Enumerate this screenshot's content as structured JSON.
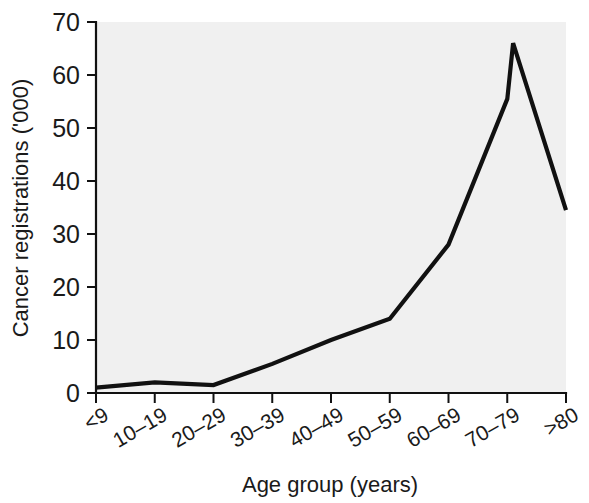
{
  "chart_data": {
    "type": "line",
    "title": "",
    "xlabel": "Age group (years)",
    "ylabel": "Cancer registrations ('000)",
    "categories": [
      "<9",
      "10–19",
      "20–29",
      "30–39",
      "40–49",
      "50–59",
      "60–69",
      "70–79",
      ">80"
    ],
    "values": [
      1,
      2,
      1.5,
      5.5,
      10,
      14,
      28,
      55.5,
      34.5
    ],
    "peak": {
      "label": "between 70–79 and >80",
      "value": 66
    },
    "series": [
      {
        "name": "Cancer registrations",
        "values": [
          1,
          2,
          1.5,
          5.5,
          10,
          14,
          28,
          55.5,
          34.5
        ]
      }
    ],
    "yticks": [
      0,
      10,
      20,
      30,
      40,
      50,
      60,
      70
    ],
    "ylim": [
      0,
      70
    ],
    "xlim_categories": 9,
    "grid": false,
    "legend": false,
    "legend_position": "none",
    "line_color": "#111111",
    "plot_background": "#f0f0f0",
    "page_background": "#ffffff"
  },
  "axes": {
    "y_title": "Cancer registrations ('000)",
    "x_title": "Age group (years)",
    "y_tick_labels": [
      "0",
      "10",
      "20",
      "30",
      "40",
      "50",
      "60",
      "70"
    ],
    "x_tick_labels": [
      "<9",
      "10–19",
      "20–29",
      "30–39",
      "40–49",
      "50–59",
      "60–69",
      "70–79",
      ">80"
    ]
  }
}
